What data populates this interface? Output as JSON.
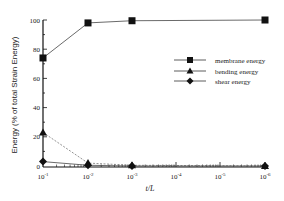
{
  "chart_data": {
    "type": "line",
    "title": "",
    "xlabel": "t/L",
    "ylabel": "Energy (% of total Strain Energy)",
    "x": [
      "10^-1",
      "10^-2",
      "10^-3",
      "10^-6"
    ],
    "x_ticks": [
      "10^-1",
      "10^-2",
      "10^-3",
      "10^-4",
      "10^-5",
      "10^-6"
    ],
    "x_scale": "log (decreasing t/L)",
    "y_ticks": [
      0,
      20,
      40,
      60,
      80,
      100
    ],
    "ylim": [
      0,
      100
    ],
    "grid": false,
    "legend_position": "right, middle",
    "series": [
      {
        "name": "membrane energy",
        "marker": "square",
        "line": "solid",
        "values": [
          74,
          98,
          99.5,
          100
        ]
      },
      {
        "name": "bending energy",
        "marker": "triangle",
        "line": "dashed",
        "values": [
          23,
          2,
          0.5,
          0
        ]
      },
      {
        "name": "shear energy",
        "marker": "diamond",
        "line": "solid",
        "values": [
          3,
          0.5,
          0,
          0
        ]
      }
    ]
  },
  "labels": {
    "xlabel": "t/L",
    "ylabel": "Energy (% of total Strain Energy)",
    "y_ticks": [
      "0",
      "20",
      "40",
      "60",
      "80",
      "100"
    ],
    "x_tick_base": "10",
    "x_tick_exps": [
      "-1",
      "-2",
      "-3",
      "-4",
      "-5",
      "-6"
    ],
    "legend": [
      "membrane energy",
      "bending energy",
      "shear energy"
    ]
  }
}
